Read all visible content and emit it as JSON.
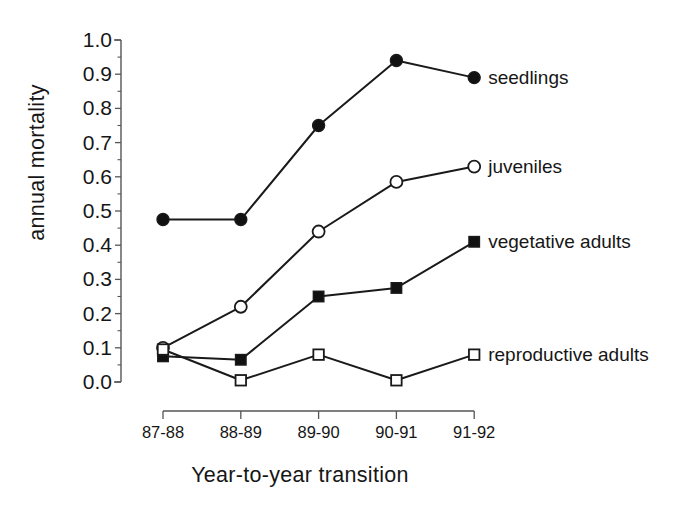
{
  "chart_data": {
    "type": "line",
    "title": "",
    "xlabel": "Year-to-year transition",
    "ylabel": "annual mortality",
    "categories": [
      "87-88",
      "88-89",
      "89-90",
      "90-91",
      "91-92"
    ],
    "ylim": [
      0.0,
      1.0
    ],
    "ytick_labels": [
      "0.0",
      "0.1",
      "0.2",
      "0.3",
      "0.4",
      "0.5",
      "0.6",
      "0.7",
      "0.8",
      "0.9",
      "1.0"
    ],
    "ytick_values": [
      0.0,
      0.1,
      0.2,
      0.3,
      0.4,
      0.5,
      0.6,
      0.7,
      0.8,
      0.9,
      1.0
    ],
    "minor_tick_step": 0.05,
    "grid": false,
    "legend_position": "right-of-last-point",
    "series": [
      {
        "name": "seedlings",
        "marker": "filled-circle",
        "values": [
          0.475,
          0.475,
          0.75,
          0.94,
          0.89
        ]
      },
      {
        "name": "juveniles",
        "marker": "open-circle",
        "values": [
          0.1,
          0.22,
          0.44,
          0.585,
          0.63
        ]
      },
      {
        "name": "vegetative adults",
        "marker": "filled-square",
        "values": [
          0.075,
          0.065,
          0.25,
          0.275,
          0.41
        ]
      },
      {
        "name": "reproductive adults",
        "marker": "open-square",
        "values": [
          0.095,
          0.005,
          0.08,
          0.005,
          0.08
        ]
      }
    ],
    "colors": {
      "line": "#1a1a1a",
      "marker_fill_solid": "#111111",
      "marker_fill_open": "#ffffff",
      "axis": "#555555",
      "text": "#161616"
    }
  }
}
